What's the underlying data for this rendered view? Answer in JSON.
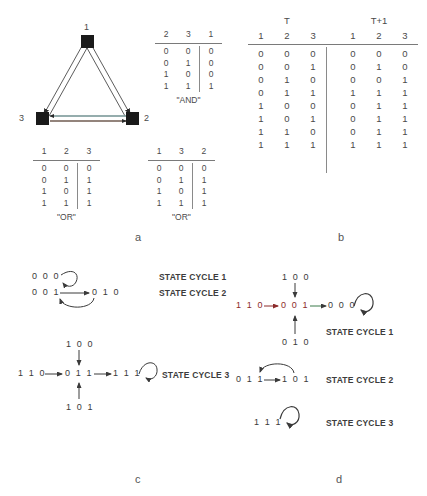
{
  "panels": {
    "a": {
      "letter": "a"
    },
    "b": {
      "letter": "b"
    },
    "c": {
      "letter": "c"
    },
    "d": {
      "letter": "d"
    }
  },
  "network": {
    "nodes": [
      {
        "id": "1",
        "label": "1"
      },
      {
        "id": "2",
        "label": "2"
      },
      {
        "id": "3",
        "label": "3"
      }
    ]
  },
  "tables": {
    "and_table": {
      "caption": "\"AND\"",
      "headers": [
        "2",
        "3",
        "1"
      ],
      "rows": [
        [
          "0",
          "0",
          "0"
        ],
        [
          "0",
          "1",
          "0"
        ],
        [
          "1",
          "0",
          "0"
        ],
        [
          "1",
          "1",
          "1"
        ]
      ]
    },
    "or_table_1": {
      "caption": "\"OR\"",
      "headers": [
        "1",
        "2",
        "3"
      ],
      "rows": [
        [
          "0",
          "0",
          "0"
        ],
        [
          "0",
          "1",
          "1"
        ],
        [
          "1",
          "0",
          "1"
        ],
        [
          "1",
          "1",
          "1"
        ]
      ]
    },
    "or_table_2": {
      "caption": "\"OR\"",
      "headers": [
        "1",
        "3",
        "2"
      ],
      "rows": [
        [
          "0",
          "0",
          "0"
        ],
        [
          "0",
          "1",
          "1"
        ],
        [
          "1",
          "0",
          "1"
        ],
        [
          "1",
          "1",
          "1"
        ]
      ]
    },
    "state_table": {
      "group_left": "T",
      "group_right": "T+1",
      "headers_left": [
        "1",
        "2",
        "3"
      ],
      "headers_right": [
        "1",
        "2",
        "3"
      ],
      "rows": [
        {
          "t": [
            "0",
            "0",
            "0"
          ],
          "t1": [
            "0",
            "0",
            "0"
          ]
        },
        {
          "t": [
            "0",
            "0",
            "1"
          ],
          "t1": [
            "0",
            "1",
            "0"
          ]
        },
        {
          "t": [
            "0",
            "1",
            "0"
          ],
          "t1": [
            "0",
            "0",
            "1"
          ]
        },
        {
          "t": [
            "0",
            "1",
            "1"
          ],
          "t1": [
            "1",
            "1",
            "1"
          ]
        },
        {
          "t": [
            "1",
            "0",
            "0"
          ],
          "t1": [
            "0",
            "1",
            "1"
          ]
        },
        {
          "t": [
            "1",
            "0",
            "1"
          ],
          "t1": [
            "0",
            "1",
            "1"
          ]
        },
        {
          "t": [
            "1",
            "1",
            "0"
          ],
          "t1": [
            "0",
            "1",
            "1"
          ]
        },
        {
          "t": [
            "1",
            "1",
            "1"
          ],
          "t1": [
            "1",
            "1",
            "1"
          ]
        }
      ]
    }
  },
  "panel_c": {
    "cycle1_state": "0 0 0",
    "cycle2_left": "0 0 1",
    "cycle2_right": "0 1 0",
    "cycle1_label": "STATE CYCLE 1",
    "cycle2_label": "STATE CYCLE 2",
    "cycle3_top": "1 0 0",
    "cycle3_left": "1 1 0",
    "cycle3_mid": "0 1 1",
    "cycle3_right": "1 1 1",
    "cycle3_bottom": "1 0 1",
    "cycle3_label": "STATE CYCLE 3"
  },
  "panel_d": {
    "cycle1_top": "1 0 0",
    "cycle1_left": "1 1 0",
    "cycle1_mid": "0 0 1",
    "cycle1_right": "0 0 0",
    "cycle1_bottom": "0 1 0",
    "cycle1_label": "STATE CYCLE 1",
    "cycle2_left": "0 1 1",
    "cycle2_right": "1 0 1",
    "cycle2_label": "STATE CYCLE 2",
    "cycle3_state": "1 1 1",
    "cycle3_label": "STATE CYCLE 3"
  },
  "colors": {
    "node": "#1a1a1a",
    "text": "#3a3a3a",
    "rule": "#7a7a7a",
    "red_state": "#8c2b2b",
    "edge_teal": "#a8d8d8",
    "edge_brown": "#8a6a5a"
  }
}
